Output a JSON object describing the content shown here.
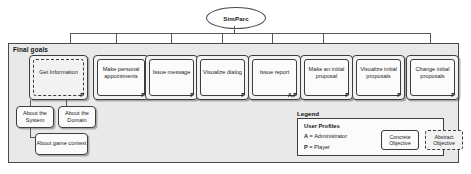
{
  "diagram": {
    "root": {
      "label": "SimParc",
      "shape": "ellipse"
    },
    "container": {
      "title": "Final goals"
    },
    "goals": [
      {
        "label": "Get Information",
        "profile": "P",
        "style": "abstract"
      },
      {
        "label": "Make personal appointments",
        "profile": "P",
        "style": "concrete"
      },
      {
        "label": "Issue message",
        "profile": "P",
        "style": "concrete"
      },
      {
        "label": "Visualize dialog",
        "profile": "P",
        "style": "concrete"
      },
      {
        "label": "Issue report",
        "profile": "A,P",
        "style": "concrete"
      },
      {
        "label": "Make an initial proposal",
        "profile": "P",
        "style": "concrete"
      },
      {
        "label": "Visualize initial proposals",
        "profile": "P",
        "style": "concrete"
      },
      {
        "label": "Change initial proposals",
        "profile": "P",
        "style": "concrete"
      }
    ],
    "subgoals": [
      {
        "label": "About the System"
      },
      {
        "label": "About the Domain"
      },
      {
        "label": "About game context"
      }
    ],
    "legend": {
      "title": "Legend",
      "heading": "User Profiles",
      "profiles": [
        {
          "key": "A",
          "sep": " = ",
          "value": "Administrator"
        },
        {
          "key": "P",
          "sep": " = ",
          "value": "Player"
        }
      ],
      "swatches": [
        {
          "label": "Concrete Objective",
          "style": "concrete"
        },
        {
          "label": "Abstract Objective",
          "style": "abstract"
        }
      ]
    },
    "colors": {
      "frame_fill": "#e9e9e9",
      "box_fill": "#fbfbfb",
      "stroke": "#3d3d3d",
      "connector": "#5a5a5a",
      "text": "#1d1d1d"
    }
  }
}
